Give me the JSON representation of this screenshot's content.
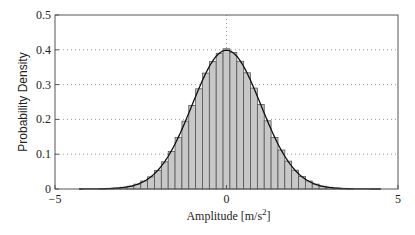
{
  "chart_data": {
    "type": "bar",
    "subtype": "histogram-with-pdf-overlay",
    "title": "",
    "xlabel": "Amplitude [m/s",
    "xlabel_superscript": "2",
    "xlabel_suffix": "]",
    "ylabel": "Probability Density",
    "xlim": [
      -5,
      5
    ],
    "ylim": [
      0,
      0.5
    ],
    "xticks": [
      -5,
      0,
      5
    ],
    "xtick_labels": [
      "−5",
      "0",
      "5"
    ],
    "yticks": [
      0,
      0.1,
      0.2,
      0.3,
      0.4,
      0.5
    ],
    "ytick_labels": [
      "0",
      "0.1",
      "0.2",
      "0.3",
      "0.4",
      "0.5"
    ],
    "grid": "dotted horizontal at y ticks; dotted vertical at x=0",
    "legend": null,
    "bin_width": 0.2,
    "bin_centers": [
      -3.6,
      -3.4,
      -3.2,
      -3.0,
      -2.8,
      -2.6,
      -2.4,
      -2.2,
      -2.0,
      -1.8,
      -1.6,
      -1.4,
      -1.2,
      -1.0,
      -0.8,
      -0.6,
      -0.4,
      -0.2,
      0.0,
      0.2,
      0.4,
      0.6,
      0.8,
      1.0,
      1.2,
      1.4,
      1.6,
      1.8,
      2.0,
      2.2,
      2.4,
      2.6,
      2.8,
      3.0,
      3.2,
      3.4,
      3.6
    ],
    "values": [
      0.001,
      0.002,
      0.003,
      0.005,
      0.008,
      0.014,
      0.023,
      0.035,
      0.053,
      0.078,
      0.108,
      0.148,
      0.195,
      0.24,
      0.288,
      0.333,
      0.366,
      0.39,
      0.403,
      0.392,
      0.367,
      0.334,
      0.29,
      0.243,
      0.196,
      0.148,
      0.112,
      0.08,
      0.054,
      0.036,
      0.023,
      0.014,
      0.008,
      0.005,
      0.003,
      0.002,
      0.001
    ],
    "series": [
      {
        "name": "histogram",
        "style": "gray bars, dark edges"
      },
      {
        "name": "normal pdf (mean 0, std 1)",
        "style": "black solid line",
        "x_range": [
          -4.3,
          4.5
        ]
      }
    ]
  },
  "colors": {
    "bar_fill": "#c8c8c8",
    "bar_edge": "#555555",
    "curve": "#111111",
    "grid": "#999999",
    "axis": "#555555"
  }
}
